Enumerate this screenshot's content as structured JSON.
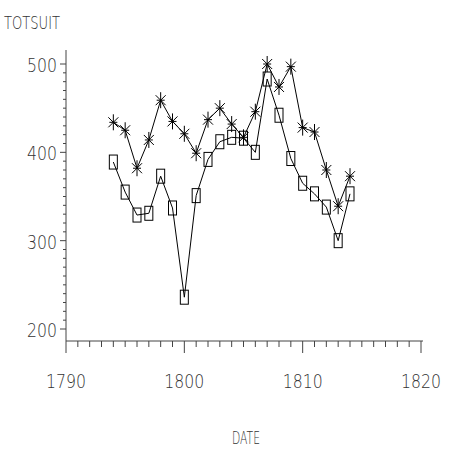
{
  "chart_data": {
    "type": "line",
    "title": "",
    "xlabel": "DATE",
    "ylabel": "TOTSUIT",
    "xlim": [
      1790,
      1820
    ],
    "ylim": [
      200,
      500
    ],
    "x_ticks": [
      1790,
      1800,
      1810,
      1820
    ],
    "y_ticks": [
      200,
      300,
      400,
      500
    ],
    "x_minor_step": 1,
    "y_minor_step": 10,
    "grid": false,
    "x": [
      1794,
      1795,
      1796,
      1797,
      1798,
      1799,
      1800,
      1801,
      1802,
      1803,
      1804,
      1805,
      1806,
      1807,
      1808,
      1809,
      1810,
      1811,
      1812,
      1813,
      1814
    ],
    "series": [
      {
        "name": "series-star",
        "marker": "star",
        "color": "#000000",
        "values": [
          434,
          425,
          382,
          414,
          459,
          435,
          421,
          399,
          437,
          450,
          432,
          417,
          446,
          500,
          474,
          497,
          428,
          423,
          380,
          339,
          373
        ]
      },
      {
        "name": "series-box",
        "marker": "box",
        "color": "#000000",
        "values": [
          389,
          355,
          329,
          331,
          373,
          337,
          236,
          351,
          392,
          412,
          417,
          416,
          400,
          483,
          442,
          393,
          365,
          353,
          338,
          300,
          353
        ]
      }
    ]
  }
}
